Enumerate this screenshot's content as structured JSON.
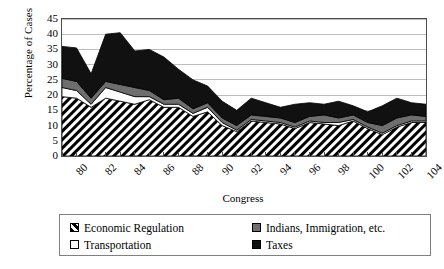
{
  "chart_data": {
    "type": "area",
    "stacked": true,
    "title": "",
    "xlabel": "Congress",
    "ylabel": "Percentage of Cases",
    "ylim": [
      0,
      45
    ],
    "ytick_values": [
      0,
      5,
      10,
      15,
      20,
      25,
      30,
      35,
      40,
      45
    ],
    "grid": true,
    "grid_axis": "y",
    "legend_position": "bottom",
    "x": [
      80,
      81,
      82,
      83,
      84,
      85,
      86,
      87,
      88,
      89,
      90,
      91,
      92,
      93,
      94,
      95,
      96,
      97,
      98,
      99,
      100,
      101,
      102,
      103,
      104,
      105
    ],
    "xtick_labels": [
      "80",
      "82",
      "84",
      "86",
      "88",
      "90",
      "92",
      "94",
      "96",
      "98",
      "100",
      "102",
      "104"
    ],
    "xtick_values": [
      80,
      82,
      84,
      86,
      88,
      90,
      92,
      94,
      96,
      98,
      100,
      102,
      104
    ],
    "series": [
      {
        "name": "Economic Regulation",
        "fill": "hatch-diagonal",
        "color": "#000000",
        "values": [
          19.5,
          19.0,
          16.0,
          19.0,
          18.0,
          17.0,
          18.5,
          16.0,
          16.0,
          13.0,
          14.5,
          10.0,
          8.0,
          11.5,
          11.0,
          10.5,
          9.0,
          11.0,
          10.5,
          10.0,
          11.5,
          9.0,
          7.0,
          9.5,
          11.0,
          11.0
        ]
      },
      {
        "name": "Transportation",
        "fill": "solid-white",
        "color": "#ffffff",
        "values": [
          3.0,
          2.5,
          1.0,
          3.5,
          3.0,
          2.5,
          1.0,
          1.0,
          1.0,
          1.0,
          1.5,
          1.0,
          0.5,
          0.5,
          0.5,
          0.5,
          0.5,
          0.5,
          0.5,
          1.0,
          0.5,
          0.5,
          0.5,
          0.5,
          0.5,
          0.5
        ]
      },
      {
        "name": "Indians, Immigration, etc.",
        "fill": "solid-gray",
        "color": "#6e6e6e",
        "values": [
          3.0,
          3.0,
          2.0,
          2.0,
          2.5,
          3.0,
          2.0,
          1.5,
          2.0,
          1.5,
          1.5,
          1.5,
          1.5,
          1.5,
          1.5,
          1.5,
          1.5,
          1.5,
          2.5,
          1.5,
          1.5,
          1.5,
          2.5,
          2.5,
          2.0,
          1.5
        ]
      },
      {
        "name": "Taxes",
        "fill": "solid-black",
        "color": "#111111",
        "values": [
          10.5,
          11.0,
          8.0,
          15.5,
          17.0,
          12.0,
          13.5,
          14.0,
          9.5,
          9.5,
          5.5,
          5.5,
          5.0,
          5.5,
          4.5,
          3.5,
          6.0,
          4.5,
          3.5,
          5.5,
          3.0,
          3.5,
          6.5,
          6.5,
          4.0,
          4.0
        ]
      }
    ],
    "stack_totals": [
      36.0,
      35.5,
      27.0,
      40.0,
      40.5,
      34.5,
      35.0,
      32.5,
      28.5,
      25.0,
      23.0,
      18.0,
      15.0,
      19.0,
      17.5,
      16.0,
      17.0,
      17.5,
      17.0,
      18.0,
      16.5,
      14.5,
      16.5,
      19.0,
      17.5,
      17.0
    ]
  },
  "legend": {
    "items": [
      {
        "label": "Economic Regulation",
        "swatch": "hatch-swatch"
      },
      {
        "label": "Indians, Immigration, etc.",
        "swatch": "gray-swatch"
      },
      {
        "label": "Transportation",
        "swatch": "white-swatch"
      },
      {
        "label": "Taxes",
        "swatch": "black-swatch"
      }
    ]
  },
  "axes": {
    "y_title": "Percentage of Cases",
    "x_title": "Congress",
    "y_labels": [
      "45",
      "40",
      "35",
      "30",
      "25",
      "20",
      "15",
      "10",
      "5",
      "0"
    ],
    "x_labels": [
      "80",
      "82",
      "84",
      "86",
      "88",
      "90",
      "92",
      "94",
      "96",
      "98",
      "100",
      "102",
      "104"
    ]
  }
}
